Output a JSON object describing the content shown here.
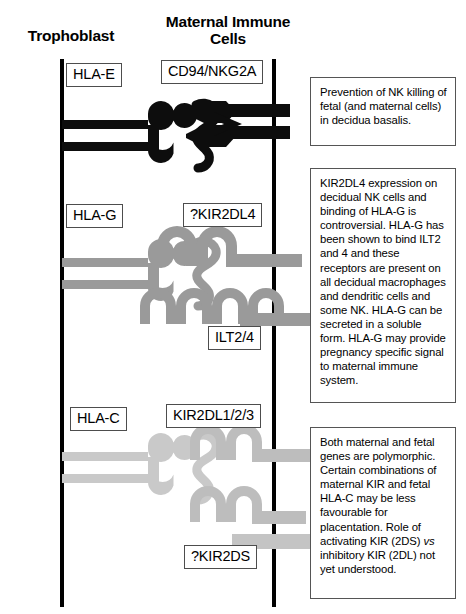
{
  "columns": {
    "left_title": "Trophoblast",
    "right_title": "Maternal Immune\nCells"
  },
  "molecule_labels": {
    "hla_e": "HLA-E",
    "cd94_nkg2a": "CD94/NKG2A",
    "hla_g": "HLA-G",
    "kir2dl4": "?KIR2DL4",
    "ilt2_4": "ILT2/4",
    "hla_c": "HLA-C",
    "kir2dl123": "KIR2DL1/2/3",
    "kir2ds": "?KIR2DS"
  },
  "notes": {
    "nk_prevention": "Prevention of NK killing of fetal (and maternal cells) in decidua basalis.",
    "kir2dl4_note": "KIR2DL4 expression on decidual NK cells and binding of HLA-G is controversial. HLA-G has been shown to bind ILT2 and 4 and these receptors are present on all decidual macrophages and dendritic cells and some NK. HLA-G can be secreted in a soluble form. HLA-G may provide pregnancy specific signal to maternal immune system.",
    "polymorphism_note_part1": "Both maternal and fetal genes are polymorphic. Certain combinations of maternal KIR and fetal HLA-C may be less favourable for placentation.  Role of activating KIR (2DS) ",
    "polymorphism_note_italic": "vs",
    "polymorphism_note_part2": " inhibitory KIR (2DL) not yet understood."
  },
  "colors": {
    "membrane": "#000000",
    "hla_e_fill": "#0d0d0d",
    "cd94_fill": "#0d0d0d",
    "hla_g_fill": "#9a9a9a",
    "kir2dl4_fill": "#9a9a9a",
    "ilt2_fill": "#9a9a9a",
    "hla_c_fill": "#c9c9c9",
    "kir2dl123_fill": "#bdbdbd",
    "kir2ds_fill": "#c4c4c4",
    "label_border": "#4d4d4d",
    "note_border": "#555555",
    "background": "#ffffff"
  }
}
